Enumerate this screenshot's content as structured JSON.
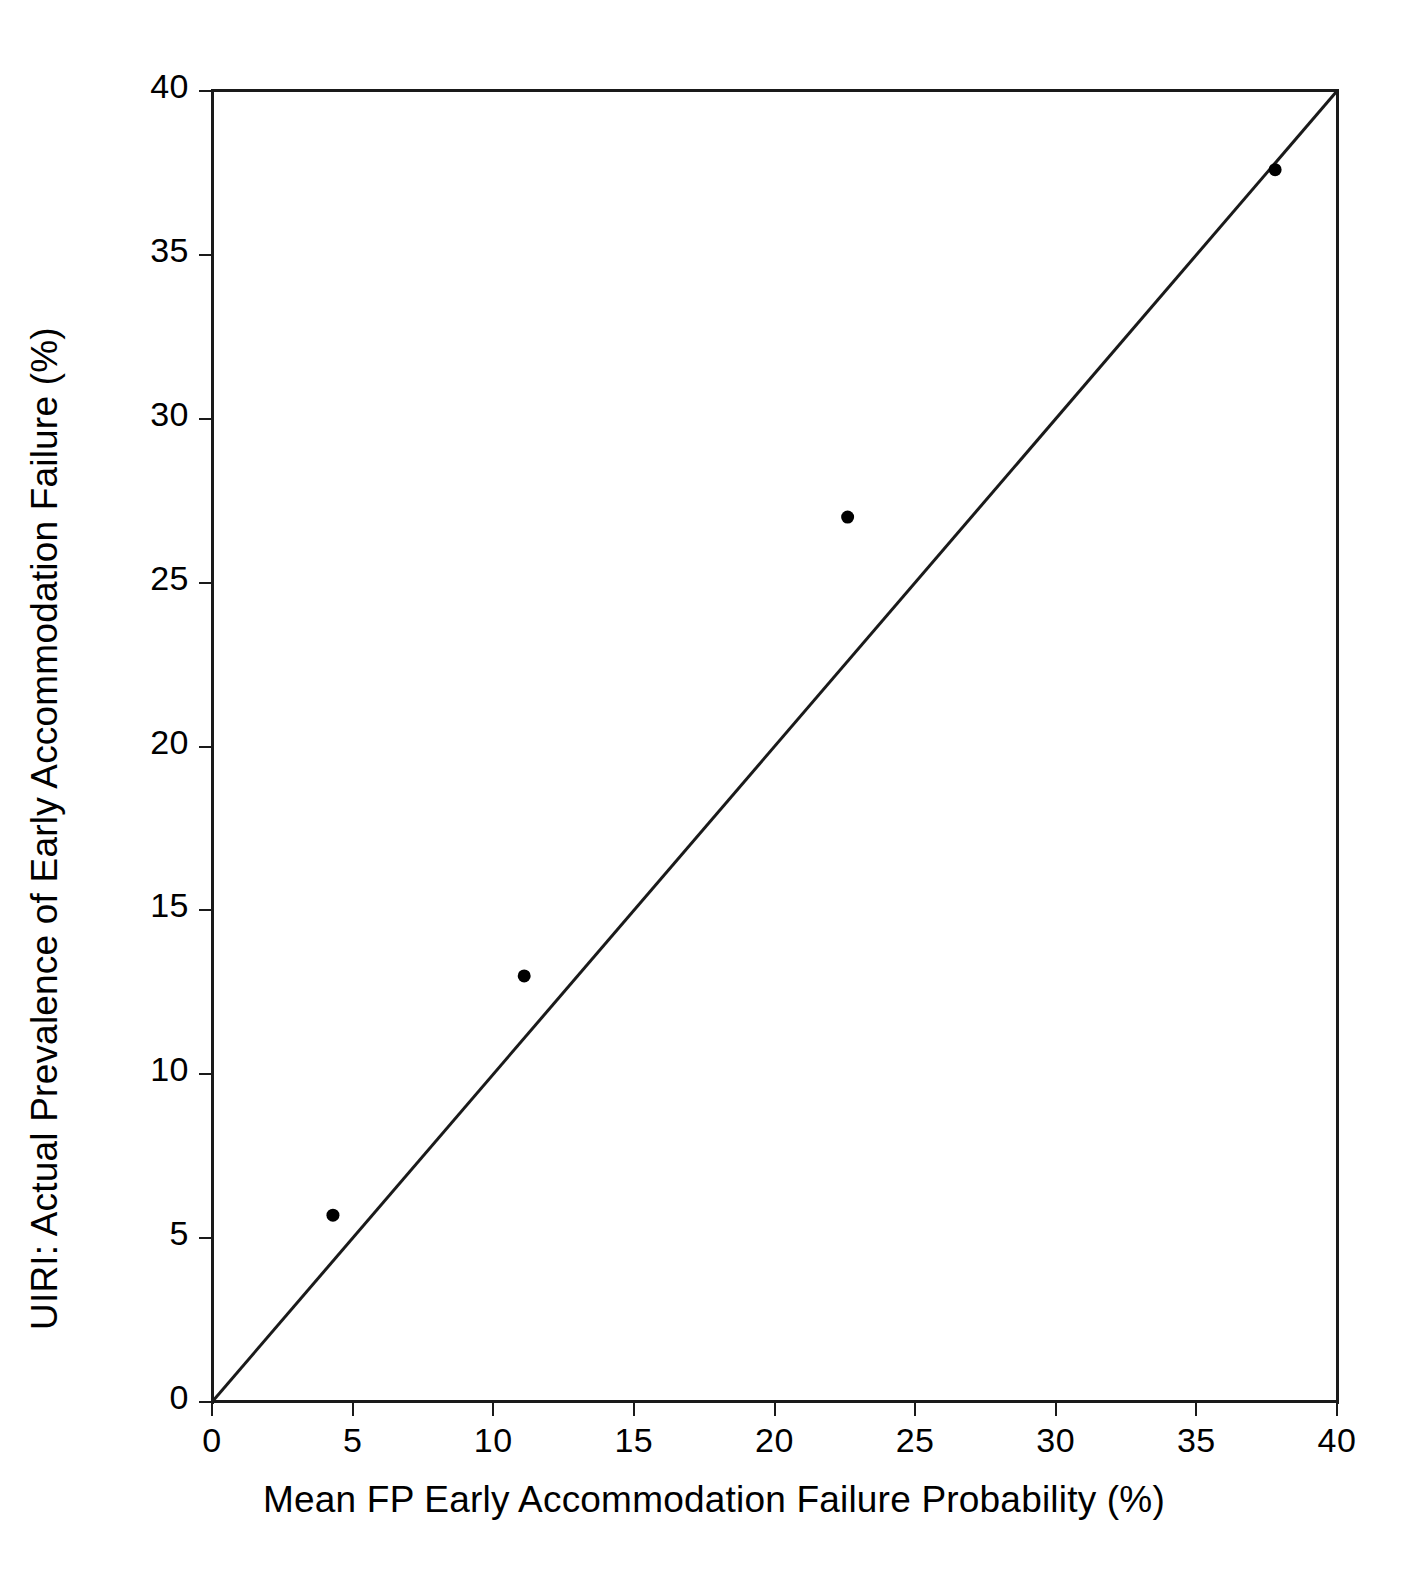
{
  "chart_data": {
    "type": "scatter",
    "title": "",
    "xlabel": "Mean FP Early Accommodation Failure Probability (%)",
    "ylabel": "UIRI: Actual Prevalence of Early Accommodation Failure (%)",
    "xlim": [
      0,
      40
    ],
    "ylim": [
      0,
      40
    ],
    "xticks": [
      0,
      5,
      10,
      15,
      20,
      25,
      30,
      35,
      40
    ],
    "yticks": [
      0,
      5,
      10,
      15,
      20,
      25,
      30,
      35,
      40
    ],
    "xtick_labels": [
      "0",
      "5",
      "10",
      "15",
      "20",
      "25",
      "30",
      "35",
      "40"
    ],
    "ytick_labels": [
      "0",
      "5",
      "10",
      "15",
      "20",
      "25",
      "30",
      "35",
      "40"
    ],
    "grid": false,
    "legend": null,
    "marker_color": "#000000",
    "line_color": "#1a1a1a",
    "points": [
      {
        "x": 4.3,
        "y": 5.7
      },
      {
        "x": 11.1,
        "y": 13.0
      },
      {
        "x": 22.6,
        "y": 27.0
      },
      {
        "x": 37.8,
        "y": 37.6
      }
    ],
    "reference_line": {
      "name": "identity-line",
      "from": {
        "x": 0,
        "y": 0
      },
      "to": {
        "x": 40,
        "y": 40
      }
    }
  }
}
